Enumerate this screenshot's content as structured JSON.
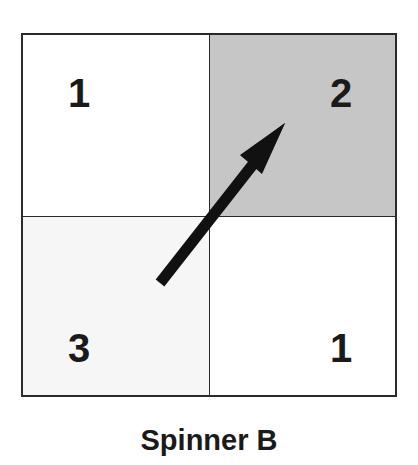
{
  "title": "Spinner B",
  "spinner": {
    "sections": [
      {
        "position": "top-left",
        "label": "1",
        "color": "#ffffff"
      },
      {
        "position": "top-right",
        "label": "2",
        "color": "#c6c6c6"
      },
      {
        "position": "bottom-left",
        "label": "3",
        "color": "#f6f6f6"
      },
      {
        "position": "bottom-right",
        "label": "1",
        "color": "#ffffff"
      }
    ],
    "arrow": {
      "pointing_to": "2",
      "icon": "arrow-pointer-icon"
    }
  }
}
